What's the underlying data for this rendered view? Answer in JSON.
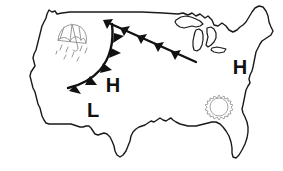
{
  "map": {
    "title": "United States Weather Map",
    "region": "Continental United States",
    "background_color": "#ffffff",
    "outline_color": "#1a1a1a",
    "outline_width": 1.4
  },
  "pressure_systems": [
    {
      "id": "high-central",
      "type": "high",
      "label": "H",
      "x": 113,
      "y": 92,
      "font_size": 20,
      "color": "#111111"
    },
    {
      "id": "low-southwest",
      "type": "low",
      "label": "L",
      "x": 93,
      "y": 117,
      "font_size": 20,
      "color": "#111111"
    },
    {
      "id": "high-east",
      "type": "high",
      "label": "H",
      "x": 240,
      "y": 74,
      "font_size": 20,
      "color": "#111111"
    }
  ],
  "fronts": [
    {
      "id": "cold-front-diagonal",
      "type": "cold",
      "symbol": "triangle-barbs",
      "color": "#111111",
      "barb_count": 5,
      "description": "Diagonal cold front from northern plains to Great Lakes"
    },
    {
      "id": "cold-front-arc",
      "type": "cold",
      "symbol": "triangle-barbs",
      "color": "#111111",
      "barb_count": 5,
      "description": "Curved cold front arcing through northwest into Rockies"
    }
  ],
  "weather_symbols": [
    {
      "id": "umbrella-rain-northwest",
      "name": "umbrella-icon",
      "meaning": "rain",
      "color": "#8c8c8c",
      "x": 72,
      "y": 40
    },
    {
      "id": "sun-southeast",
      "name": "sun-icon",
      "meaning": "clear sunny",
      "color": "#9a9a9a",
      "x": 219,
      "y": 107
    }
  ],
  "geography": {
    "great_lakes_visible": true,
    "florida_visible": true,
    "labels": []
  }
}
